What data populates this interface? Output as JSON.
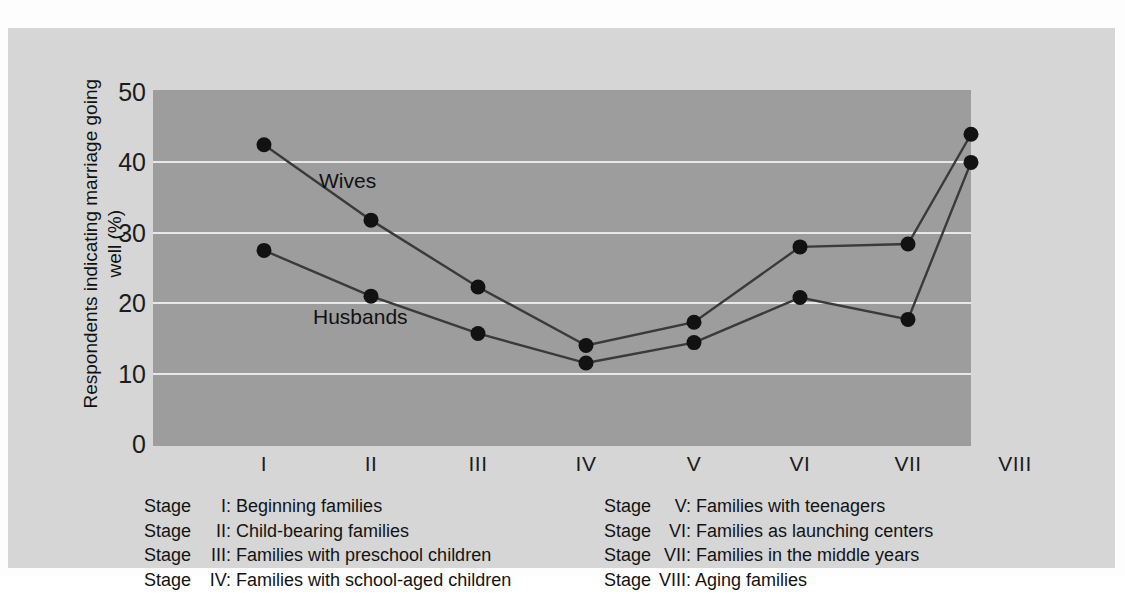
{
  "chart_data": {
    "type": "line",
    "title": "",
    "xlabel": "",
    "ylabel": "Respondents indicating marriage going well (%)",
    "ylim": [
      0,
      50
    ],
    "yticks": [
      0,
      10,
      20,
      30,
      40,
      50
    ],
    "grid": "horizontal",
    "legend_position": "inline",
    "categories": [
      "I",
      "II",
      "III",
      "IV",
      "V",
      "VI",
      "VII",
      "VIII"
    ],
    "series": [
      {
        "name": "Wives",
        "values": [
          42.5,
          31.8,
          22.3,
          14.0,
          17.3,
          28.0,
          28.4,
          44.0
        ]
      },
      {
        "name": "Husbands",
        "values": [
          27.5,
          21.0,
          15.7,
          11.5,
          14.4,
          20.8,
          17.7,
          40.0
        ]
      }
    ],
    "annotations": [
      "Wives",
      "Husbands"
    ]
  },
  "axis": {
    "y_title": "Respondents indicating marriage going well (%)",
    "y_ticks": [
      "50",
      "40",
      "30",
      "20",
      "10",
      "0"
    ],
    "x_ticks": [
      "I",
      "II",
      "III",
      "IV",
      "V",
      "VI",
      "VII",
      "VIII"
    ]
  },
  "series_labels": {
    "wives": "Wives",
    "husbands": "Husbands"
  },
  "legend": {
    "left_column": [
      {
        "stage": "Stage",
        "numeral": "I:",
        "description": "Beginning families"
      },
      {
        "stage": "Stage",
        "numeral": "II:",
        "description": "Child-bearing families"
      },
      {
        "stage": "Stage",
        "numeral": "III:",
        "description": "Families with preschool children"
      },
      {
        "stage": "Stage",
        "numeral": "IV:",
        "description": "Families with school-aged children"
      }
    ],
    "right_column": [
      {
        "stage": "Stage",
        "numeral": "V:",
        "description": "Families with teenagers"
      },
      {
        "stage": "Stage",
        "numeral": "VI:",
        "description": "Families as launching centers"
      },
      {
        "stage": "Stage",
        "numeral": "VII:",
        "description": "Families in the middle years"
      },
      {
        "stage": "Stage",
        "numeral": "VIII:",
        "description": "Aging families"
      }
    ]
  },
  "colors": {
    "page_background": "#fdfdfd",
    "panel_background": "#d6d6d6",
    "plot_background": "#9d9d9d",
    "gridline": "#e8e8e8",
    "line": "#3a3a3a",
    "marker": "#121212",
    "text": "#1c1c1c"
  }
}
